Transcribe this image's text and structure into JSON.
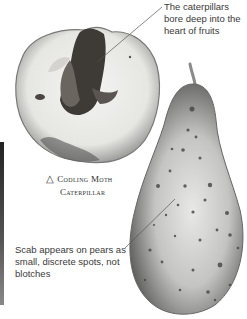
{
  "captions": {
    "caterpillar_note": "The caterpillars bore deep into the heart of fruits",
    "scab_note": "Scab appears on pears as small, discrete spots, not blotches"
  },
  "photo_label": {
    "icon": "triangle-icon",
    "symbol": "△",
    "line1": "Codling Moth",
    "line2": "Caterpillar"
  },
  "images": {
    "apple": "Apple cut in half showing codling moth caterpillar tunnel",
    "pear": "Pear with scab spots"
  }
}
